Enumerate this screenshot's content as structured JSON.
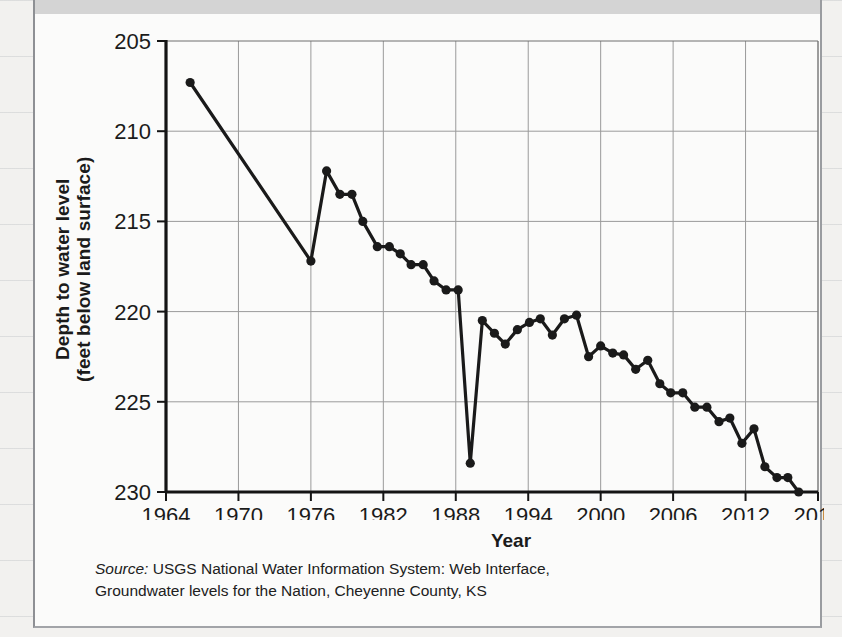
{
  "figure": {
    "header_band": "",
    "axis": {
      "y_label_line1": "Depth to water level",
      "y_label_line2": "(feet below land surface)",
      "x_label": "Year"
    },
    "source": {
      "prefix": "Source:",
      "line1": " USGS National Water Information System: Web Interface,",
      "line2": "Groundwater levels for the Nation, Cheyenne County, KS"
    }
  },
  "chart_data": {
    "type": "line",
    "title": "",
    "xlabel": "Year",
    "ylabel": "Depth to water level (feet below land surface)",
    "xlim": [
      1964,
      2018
    ],
    "ylim": [
      205,
      230
    ],
    "y_inverted": true,
    "grid": true,
    "legend": null,
    "xticks": [
      1964,
      1970,
      1976,
      1982,
      1988,
      1994,
      2000,
      2006,
      2012,
      2018
    ],
    "yticks": [
      205,
      210,
      215,
      220,
      225,
      230
    ],
    "marker": "filled-circle",
    "line_color": "#1a1a1a",
    "grid_color": "#9a9a9a",
    "series": [
      {
        "name": "Depth to water level",
        "points": [
          [
            1966.0,
            207.3
          ],
          [
            1976.0,
            217.2
          ],
          [
            1977.3,
            212.2
          ],
          [
            1978.4,
            213.5
          ],
          [
            1979.4,
            213.5
          ],
          [
            1980.3,
            215.0
          ],
          [
            1981.5,
            216.4
          ],
          [
            1982.5,
            216.4
          ],
          [
            1983.4,
            216.8
          ],
          [
            1984.3,
            217.4
          ],
          [
            1985.3,
            217.4
          ],
          [
            1986.2,
            218.3
          ],
          [
            1987.2,
            218.8
          ],
          [
            1988.2,
            218.8
          ],
          [
            1989.2,
            228.4
          ],
          [
            1990.2,
            220.5
          ],
          [
            1991.2,
            221.2
          ],
          [
            1992.1,
            221.8
          ],
          [
            1993.1,
            221.0
          ],
          [
            1994.1,
            220.6
          ],
          [
            1995.0,
            220.4
          ],
          [
            1996.0,
            221.3
          ],
          [
            1997.0,
            220.4
          ],
          [
            1998.0,
            220.2
          ],
          [
            1999.0,
            222.5
          ],
          [
            2000.0,
            221.9
          ],
          [
            2001.0,
            222.3
          ],
          [
            2001.9,
            222.4
          ],
          [
            2002.9,
            223.2
          ],
          [
            2003.9,
            222.7
          ],
          [
            2004.9,
            224.0
          ],
          [
            2005.8,
            224.5
          ],
          [
            2006.8,
            224.5
          ],
          [
            2007.8,
            225.3
          ],
          [
            2008.8,
            225.3
          ],
          [
            2009.8,
            226.1
          ],
          [
            2010.7,
            225.9
          ],
          [
            2011.7,
            227.3
          ],
          [
            2012.7,
            226.5
          ],
          [
            2013.6,
            228.6
          ],
          [
            2014.6,
            229.2
          ],
          [
            2015.5,
            229.2
          ],
          [
            2016.4,
            230.0
          ]
        ]
      }
    ]
  }
}
